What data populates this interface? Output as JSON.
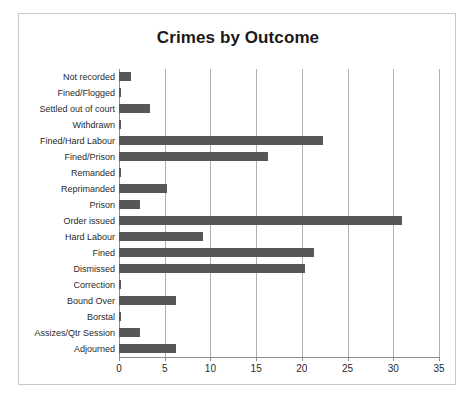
{
  "chart_data": {
    "type": "bar",
    "orientation": "horizontal",
    "title": "Crimes by Outcome",
    "xlabel": "",
    "ylabel": "",
    "xlim": [
      0,
      35
    ],
    "xticks": [
      0,
      5,
      10,
      15,
      20,
      25,
      30,
      35
    ],
    "grid": "vertical",
    "legend": "none",
    "bar_color": "#575757",
    "categories": [
      "Not recorded",
      "Fined/Flogged",
      "Settled out of court",
      "Withdrawn",
      "Fined/Hard Labour",
      "Fined/Prison",
      "Remanded",
      "Reprimanded",
      "Prison",
      "Order issued",
      "Hard Labour",
      "Fined",
      "Dismissed",
      "Correction",
      "Bound Over",
      "Borstal",
      "Assizes/Qtr Session",
      "Adjourned"
    ],
    "values": [
      1.3,
      0.2,
      3.4,
      0.2,
      22.3,
      16.3,
      0.2,
      5.2,
      2.3,
      31.0,
      9.2,
      21.3,
      20.3,
      0.2,
      6.2,
      0.2,
      2.3,
      6.2
    ]
  }
}
